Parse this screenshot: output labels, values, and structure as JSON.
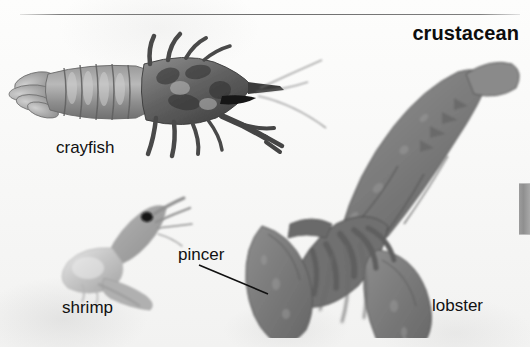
{
  "figure": {
    "title": "crustacean",
    "background_color": "#fbfbfa",
    "rule_color": "#6e6e6e"
  },
  "labels": {
    "crayfish": "crayfish",
    "shrimp": "shrimp",
    "pincer": "pincer",
    "lobster": "lobster"
  },
  "specimens": [
    {
      "name": "crayfish",
      "caption": "crayfish",
      "tone": "#8a8a8a",
      "orientation": "horizontal, tail at left, head and antennae at right"
    },
    {
      "name": "lobster",
      "caption": "lobster",
      "tone": "#7d7d7d",
      "orientation": "diagonal, tail fan at upper right, two large pincers at lower left"
    },
    {
      "name": "shrimp",
      "caption": "shrimp",
      "tone": "#c9c9c9",
      "orientation": "curved, head and eye at upper right"
    }
  ],
  "callouts": [
    {
      "name": "pincer",
      "label": "pincer",
      "points_to": "lobster left claw",
      "leader_color": "#101010"
    }
  ],
  "page_tab": {
    "name": "page-thumb-tab",
    "color": "#989898"
  }
}
